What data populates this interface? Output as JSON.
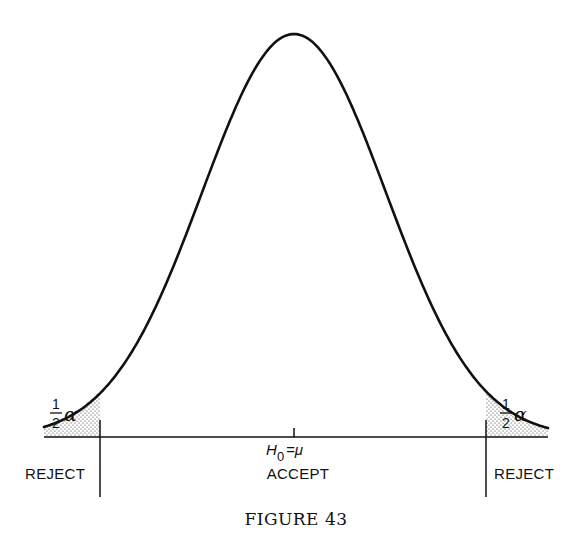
{
  "figure": {
    "caption": "FIGURE 43",
    "hypothesis_label": {
      "H": "H",
      "sub": "0",
      "rest": "=μ"
    },
    "accept_label": "ACCEPT",
    "reject_left_label": "REJECT",
    "reject_right_label": "REJECT",
    "tail_left": {
      "num": "1",
      "den": "2",
      "symbol": "α"
    },
    "tail_right": {
      "num": "1",
      "den": "2",
      "symbol": "α"
    },
    "colors": {
      "ink": "#111111",
      "background": "#ffffff"
    }
  },
  "chart_data": {
    "type": "area",
    "title": "FIGURE 43",
    "distribution": "normal",
    "center_label": "H0 = μ",
    "regions": [
      {
        "name": "REJECT",
        "side": "left",
        "area_label": "½α",
        "shaded": true
      },
      {
        "name": "ACCEPT",
        "side": "center",
        "shaded": false
      },
      {
        "name": "REJECT",
        "side": "right",
        "area_label": "½α",
        "shaded": true
      }
    ],
    "xlabel": "",
    "ylabel": "",
    "grid": false
  }
}
